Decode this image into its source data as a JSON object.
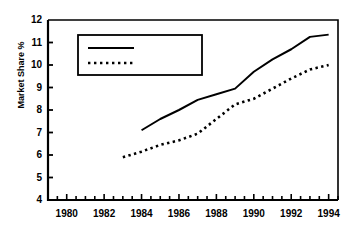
{
  "chart_data": {
    "type": "line",
    "title": "",
    "xlabel": "",
    "ylabel": "Market Share %",
    "xlim": [
      1979,
      1994.5
    ],
    "ylim": [
      4,
      12
    ],
    "grid": false,
    "legend_position": "upper-left-inside",
    "x_ticks": [
      1980,
      1982,
      1984,
      1986,
      1988,
      1990,
      1992,
      1994
    ],
    "x_tick_labels": [
      "1980",
      "1982",
      "1984",
      "1986",
      "1988",
      "1990",
      "1992",
      "1994"
    ],
    "x_minor_tick_step": 0.5,
    "y_ticks": [
      4,
      5,
      6,
      7,
      8,
      9,
      10,
      11,
      12
    ],
    "y_tick_labels": [
      "4",
      "5",
      "6",
      "7",
      "8",
      "9",
      "10",
      "11",
      "12"
    ],
    "series": [
      {
        "name": "Sainsbury's",
        "style": "solid",
        "color": "#000000",
        "x": [
          1984,
          1985,
          1986,
          1987,
          1988,
          1989,
          1990,
          1991,
          1992,
          1993,
          1994
        ],
        "values": [
          7.1,
          7.6,
          8.0,
          8.45,
          8.7,
          8.95,
          9.7,
          10.25,
          10.7,
          11.25,
          11.35
        ]
      },
      {
        "name": "Tesco",
        "style": "dotted",
        "color": "#000000",
        "x": [
          1983,
          1984,
          1985,
          1986,
          1987,
          1988,
          1989,
          1990,
          1991,
          1992,
          1993,
          1994
        ],
        "values": [
          5.9,
          6.15,
          6.45,
          6.65,
          6.95,
          7.6,
          8.25,
          8.5,
          8.95,
          9.4,
          9.8,
          10.0
        ]
      }
    ]
  },
  "legend": {
    "items": [
      {
        "label": "Sainsbury's",
        "style": "solid"
      },
      {
        "label": "Tesco",
        "style": "dotted"
      }
    ]
  },
  "axis": {
    "y_title": "Market Share %"
  }
}
